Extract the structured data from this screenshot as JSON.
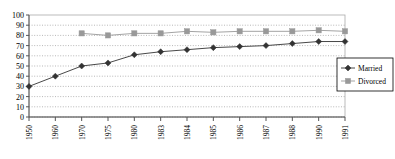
{
  "chart_data": {
    "type": "line",
    "title": "",
    "xlabel": "",
    "ylabel": "",
    "ylim": [
      0,
      100
    ],
    "ytick_step": 10,
    "yticks": [
      "0",
      "10",
      "20",
      "30",
      "40",
      "50",
      "60",
      "70",
      "80",
      "90",
      "100"
    ],
    "grid": true,
    "grid_style": "dotted-horizontal",
    "legend_position": "right",
    "categories": [
      "1950",
      "1960",
      "1970",
      "1975",
      "1980",
      "1983",
      "1984",
      "1985",
      "1986",
      "1987",
      "1988",
      "1990",
      "1991"
    ],
    "series": [
      {
        "name": "Married",
        "marker": "diamond",
        "color": "#333333",
        "values": [
          30,
          40,
          50,
          53,
          61,
          64,
          66,
          68,
          69,
          70,
          72,
          74,
          74
        ]
      },
      {
        "name": "Divorced",
        "marker": "square",
        "color": "#999999",
        "values": [
          null,
          null,
          82,
          80,
          82,
          82,
          84,
          83,
          84,
          84,
          84,
          85,
          84
        ]
      }
    ]
  },
  "legend": {
    "entries": [
      {
        "label": "Married"
      },
      {
        "label": "Divorced"
      }
    ]
  },
  "colors": {
    "married": "#333333",
    "divorced": "#999999",
    "axis": "#555555",
    "grid": "#999999",
    "plot_border": "#aaaaaa",
    "background": "#ffffff"
  }
}
